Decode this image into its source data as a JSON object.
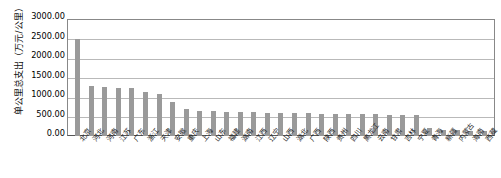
{
  "chart_data": {
    "type": "bar",
    "title": "",
    "xlabel": "",
    "ylabel": "单公里总支出（万元/公里）",
    "ylim": [
      0,
      3000
    ],
    "ytick_labels": [
      "3000.00",
      "2500.00",
      "2000.00",
      "1500.00",
      "1000.00",
      "500.00",
      "0.00"
    ],
    "ytick_values": [
      3000,
      2500,
      2000,
      1500,
      1000,
      500,
      0
    ],
    "grid": true,
    "legend": "none",
    "bar_color": "#9a9a9a",
    "categories": [
      "北京",
      "河北",
      "河南",
      "江苏",
      "广东",
      "浙江",
      "天津",
      "安徽",
      "重庆",
      "上海",
      "山东",
      "福建",
      "湖南",
      "江西",
      "辽宁",
      "山西",
      "湖北",
      "广西",
      "陕西",
      "贵州",
      "四川",
      "黑龙江",
      "云南",
      "甘肃",
      "吉林",
      "宁夏",
      "青海",
      "新疆",
      "内蒙古",
      "海南",
      "西藏"
    ],
    "values": [
      2510,
      1290,
      1255,
      1240,
      1235,
      1150,
      1080,
      870,
      700,
      650,
      640,
      630,
      620,
      615,
      605,
      600,
      595,
      590,
      580,
      575,
      570,
      565,
      560,
      555,
      550,
      545,
      200,
      150,
      145,
      140,
      135
    ]
  }
}
